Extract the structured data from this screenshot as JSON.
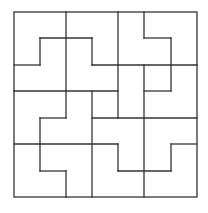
{
  "puzzle": {
    "type": "tiling-grid",
    "grid_size": 7,
    "line_color": "#333333",
    "background": "#ffffff",
    "x_positions": [
      14,
      40,
      66,
      92,
      118,
      144,
      171,
      197
    ],
    "y_positions": [
      12,
      38,
      65,
      91,
      118,
      144,
      171,
      197
    ],
    "segments": [
      [
        2,
        0,
        2,
        4
      ],
      [
        2,
        6,
        2,
        7
      ],
      [
        1,
        1,
        3,
        1
      ],
      [
        1,
        1,
        1,
        2
      ],
      [
        0,
        2,
        1,
        2
      ],
      [
        3,
        1,
        3,
        2
      ],
      [
        3,
        2,
        7,
        2
      ],
      [
        4,
        0,
        4,
        2
      ],
      [
        5,
        0,
        5,
        1
      ],
      [
        5,
        1,
        6,
        1
      ],
      [
        6,
        1,
        6,
        3
      ],
      [
        0,
        3,
        4,
        3
      ],
      [
        5,
        3,
        6,
        3
      ],
      [
        4,
        2,
        4,
        4
      ],
      [
        5,
        2,
        5,
        7
      ],
      [
        3,
        3,
        3,
        7
      ],
      [
        3,
        4,
        7,
        4
      ],
      [
        1,
        4,
        2,
        4
      ],
      [
        1,
        4,
        1,
        6
      ],
      [
        0,
        5,
        4,
        5
      ],
      [
        6,
        5,
        7,
        5
      ],
      [
        6,
        5,
        6,
        6
      ],
      [
        4,
        6,
        6,
        6
      ],
      [
        4,
        5,
        4,
        6
      ],
      [
        1,
        6,
        2,
        6
      ]
    ]
  }
}
